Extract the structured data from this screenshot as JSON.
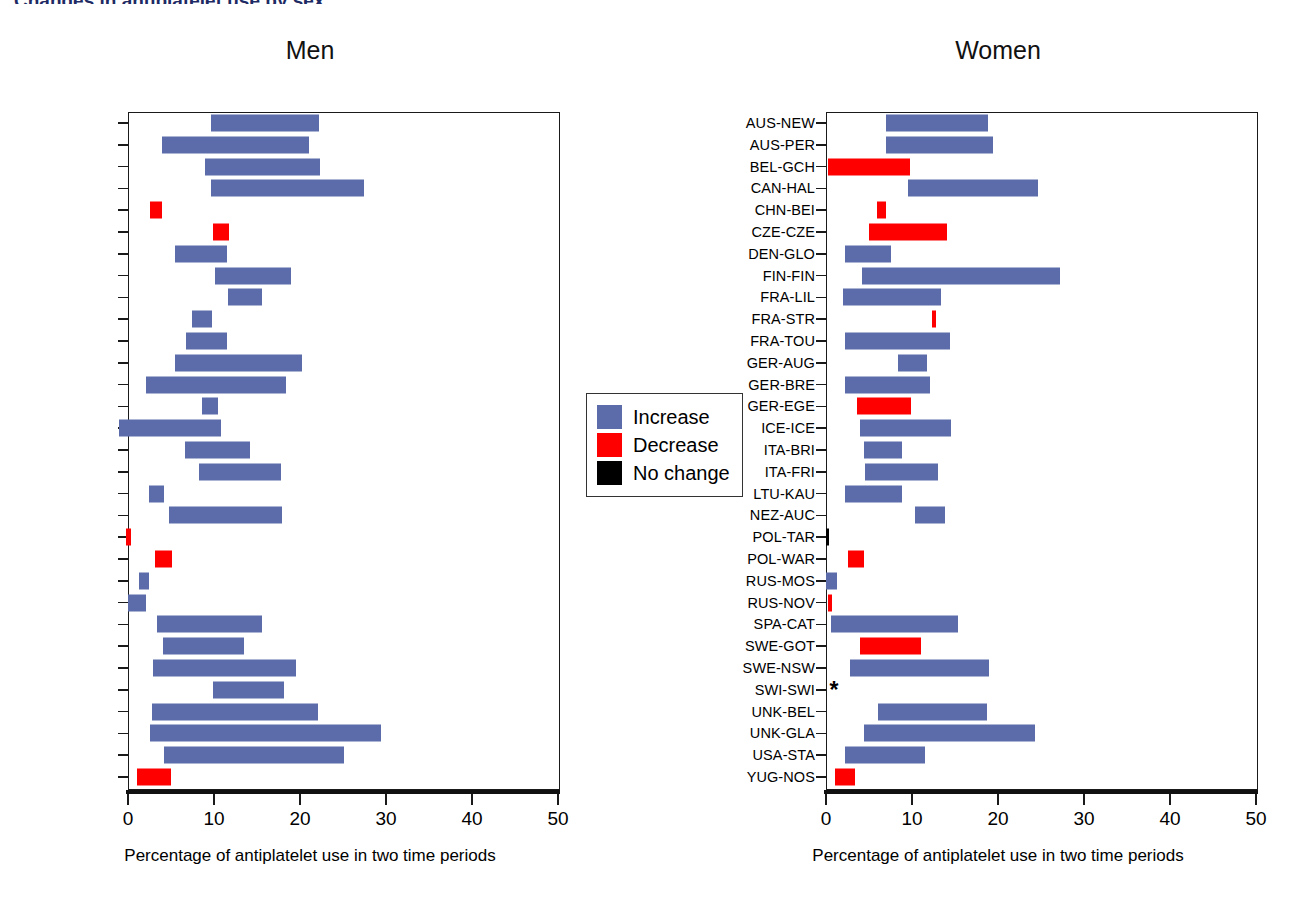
{
  "figure": {
    "cut_title": "Changes in antiplatelet use by sex",
    "axis_title": "Percentage of antiplatelet use in two time periods",
    "colors": {
      "increase": "#5c6cab",
      "decrease": "#fe0000",
      "no_change": "#000000"
    }
  },
  "legend": {
    "items": [
      {
        "label": "Increase",
        "key": "increase"
      },
      {
        "label": "Decrease",
        "key": "decrease"
      },
      {
        "label": "No change",
        "key": "no_change"
      }
    ]
  },
  "panels": [
    {
      "id": "men",
      "title": "Men"
    },
    {
      "id": "women",
      "title": "Women"
    }
  ],
  "chart_data": [
    {
      "type": "bar",
      "orientation": "horizontal",
      "title": "Men",
      "xlabel": "Percentage of antiplatelet use in two time periods",
      "ylabel": "",
      "xlim": [
        0,
        50
      ],
      "xticks": [
        0,
        10,
        20,
        30,
        40,
        50
      ],
      "grid": false,
      "legend": [
        "Increase",
        "Decrease",
        "No change"
      ],
      "note": "Each bar spans the two time-period percentages; color encodes direction of change.",
      "categories": [
        "AUS-NEW",
        "AUS-PER",
        "BEL-GCH",
        "CAN-HAL",
        "CHN-BEI",
        "CZE-CZE",
        "DEN-GLO",
        "FIN-FIN",
        "FRA-LIL",
        "FRA-STR",
        "FRA-TOU",
        "GER-AUG",
        "GER-BRE",
        "GER-EGE",
        "ICE-ICE",
        "ITA-BRI",
        "ITA-FRI",
        "LTU-KAU",
        "NEZ-AUC",
        "POL-TAR",
        "POL-WAR",
        "RUS-MOS",
        "RUS-NOV",
        "SPA-CAT",
        "SWE-GOT",
        "SWE-NSW",
        "SWI-SWI",
        "UNK-BEL",
        "UNK-GLA",
        "USA-STA",
        "YUG-NOS"
      ],
      "bars": [
        {
          "category": "AUS-NEW",
          "start": 9.7,
          "end": 22.2,
          "change": "increase"
        },
        {
          "category": "AUS-PER",
          "start": 4.0,
          "end": 21.0,
          "change": "increase"
        },
        {
          "category": "BEL-GCH",
          "start": 9.0,
          "end": 22.3,
          "change": "increase"
        },
        {
          "category": "CAN-HAL",
          "start": 9.6,
          "end": 27.5,
          "change": "increase"
        },
        {
          "category": "CHN-BEI",
          "start": 2.6,
          "end": 4.0,
          "change": "decrease"
        },
        {
          "category": "CZE-CZE",
          "start": 9.9,
          "end": 11.8,
          "change": "decrease"
        },
        {
          "category": "DEN-GLO",
          "start": 5.5,
          "end": 11.5,
          "change": "increase"
        },
        {
          "category": "FIN-FIN",
          "start": 10.1,
          "end": 18.9,
          "change": "increase"
        },
        {
          "category": "FRA-LIL",
          "start": 11.6,
          "end": 15.6,
          "change": "increase"
        },
        {
          "category": "FRA-STR",
          "start": 7.4,
          "end": 9.8,
          "change": "increase"
        },
        {
          "category": "FRA-TOU",
          "start": 6.8,
          "end": 11.5,
          "change": "increase"
        },
        {
          "category": "GER-AUG",
          "start": 5.5,
          "end": 20.2,
          "change": "increase"
        },
        {
          "category": "GER-BRE",
          "start": 2.1,
          "end": 18.4,
          "change": "increase"
        },
        {
          "category": "GER-EGE",
          "start": 8.6,
          "end": 10.5,
          "change": "increase"
        },
        {
          "category": "ICE-ICE",
          "start": -1.0,
          "end": 10.8,
          "change": "increase"
        },
        {
          "category": "ITA-BRI",
          "start": 6.6,
          "end": 14.2,
          "change": "increase"
        },
        {
          "category": "ITA-FRI",
          "start": 8.2,
          "end": 17.8,
          "change": "increase"
        },
        {
          "category": "LTU-KAU",
          "start": 2.4,
          "end": 4.2,
          "change": "increase"
        },
        {
          "category": "NEZ-AUC",
          "start": 4.8,
          "end": 17.9,
          "change": "increase"
        },
        {
          "category": "POL-TAR",
          "start": -0.2,
          "end": 0.3,
          "change": "decrease"
        },
        {
          "category": "POL-WAR",
          "start": 3.1,
          "end": 5.1,
          "change": "decrease"
        },
        {
          "category": "RUS-MOS",
          "start": 1.3,
          "end": 2.4,
          "change": "increase"
        },
        {
          "category": "RUS-NOV",
          "start": 0.0,
          "end": 2.1,
          "change": "increase"
        },
        {
          "category": "SPA-CAT",
          "start": 3.4,
          "end": 15.6,
          "change": "increase"
        },
        {
          "category": "SWE-GOT",
          "start": 4.1,
          "end": 13.5,
          "change": "increase"
        },
        {
          "category": "SWE-NSW",
          "start": 2.9,
          "end": 19.5,
          "change": "increase"
        },
        {
          "category": "SWI-SWI",
          "start": 9.9,
          "end": 18.1,
          "change": "increase"
        },
        {
          "category": "UNK-BEL",
          "start": 2.8,
          "end": 22.1,
          "change": "increase"
        },
        {
          "category": "UNK-GLA",
          "start": 2.6,
          "end": 29.4,
          "change": "increase"
        },
        {
          "category": "USA-STA",
          "start": 4.2,
          "end": 25.1,
          "change": "increase"
        },
        {
          "category": "YUG-NOS",
          "start": 1.0,
          "end": 5.0,
          "change": "decrease"
        }
      ]
    },
    {
      "type": "bar",
      "orientation": "horizontal",
      "title": "Women",
      "xlabel": "Percentage of antiplatelet use in two time periods",
      "ylabel": "",
      "xlim": [
        0,
        50
      ],
      "xticks": [
        0,
        10,
        20,
        30,
        40,
        50
      ],
      "grid": false,
      "legend": [
        "Increase",
        "Decrease",
        "No change"
      ],
      "note": "SWI-SWI marked with asterisk (no data shown).",
      "categories": [
        "AUS-NEW",
        "AUS-PER",
        "BEL-GCH",
        "CAN-HAL",
        "CHN-BEI",
        "CZE-CZE",
        "DEN-GLO",
        "FIN-FIN",
        "FRA-LIL",
        "FRA-STR",
        "FRA-TOU",
        "GER-AUG",
        "GER-BRE",
        "GER-EGE",
        "ICE-ICE",
        "ITA-BRI",
        "ITA-FRI",
        "LTU-KAU",
        "NEZ-AUC",
        "POL-TAR",
        "POL-WAR",
        "RUS-MOS",
        "RUS-NOV",
        "SPA-CAT",
        "SWE-GOT",
        "SWE-NSW",
        "SWI-SWI",
        "UNK-BEL",
        "UNK-GLA",
        "USA-STA",
        "YUG-NOS"
      ],
      "bars": [
        {
          "category": "AUS-NEW",
          "start": 7.0,
          "end": 18.8,
          "change": "increase"
        },
        {
          "category": "AUS-PER",
          "start": 7.0,
          "end": 19.4,
          "change": "increase"
        },
        {
          "category": "BEL-GCH",
          "start": 0.2,
          "end": 9.8,
          "change": "decrease"
        },
        {
          "category": "CAN-HAL",
          "start": 9.5,
          "end": 24.6,
          "change": "increase"
        },
        {
          "category": "CHN-BEI",
          "start": 5.9,
          "end": 7.0,
          "change": "decrease"
        },
        {
          "category": "CZE-CZE",
          "start": 5.0,
          "end": 14.1,
          "change": "decrease"
        },
        {
          "category": "DEN-GLO",
          "start": 2.2,
          "end": 7.6,
          "change": "increase"
        },
        {
          "category": "FIN-FIN",
          "start": 4.2,
          "end": 27.2,
          "change": "increase"
        },
        {
          "category": "FRA-LIL",
          "start": 2.0,
          "end": 13.4,
          "change": "increase"
        },
        {
          "category": "FRA-STR",
          "start": 12.3,
          "end": 12.8,
          "change": "decrease"
        },
        {
          "category": "FRA-TOU",
          "start": 2.2,
          "end": 14.4,
          "change": "increase"
        },
        {
          "category": "GER-AUG",
          "start": 8.4,
          "end": 11.8,
          "change": "increase"
        },
        {
          "category": "GER-BRE",
          "start": 2.2,
          "end": 12.1,
          "change": "increase"
        },
        {
          "category": "GER-EGE",
          "start": 3.6,
          "end": 9.9,
          "change": "decrease"
        },
        {
          "category": "ICE-ICE",
          "start": 3.9,
          "end": 14.5,
          "change": "increase"
        },
        {
          "category": "ITA-BRI",
          "start": 4.4,
          "end": 8.8,
          "change": "increase"
        },
        {
          "category": "ITA-FRI",
          "start": 4.5,
          "end": 13.0,
          "change": "increase"
        },
        {
          "category": "LTU-KAU",
          "start": 2.2,
          "end": 8.8,
          "change": "increase"
        },
        {
          "category": "NEZ-AUC",
          "start": 10.3,
          "end": 13.8,
          "change": "increase"
        },
        {
          "category": "POL-TAR",
          "start": 0.0,
          "end": 0.3,
          "change": "no_change"
        },
        {
          "category": "POL-WAR",
          "start": 2.5,
          "end": 4.4,
          "change": "decrease"
        },
        {
          "category": "RUS-MOS",
          "start": 0.0,
          "end": 1.3,
          "change": "increase"
        },
        {
          "category": "RUS-NOV",
          "start": 0.2,
          "end": 0.7,
          "change": "decrease"
        },
        {
          "category": "SPA-CAT",
          "start": 0.6,
          "end": 15.4,
          "change": "increase"
        },
        {
          "category": "SWE-GOT",
          "start": 3.9,
          "end": 11.0,
          "change": "decrease"
        },
        {
          "category": "SWE-NSW",
          "start": 2.8,
          "end": 18.9,
          "change": "increase"
        },
        {
          "category": "SWI-SWI",
          "start": null,
          "end": null,
          "change": "none",
          "marker": "*"
        },
        {
          "category": "UNK-BEL",
          "start": 6.0,
          "end": 18.7,
          "change": "increase"
        },
        {
          "category": "UNK-GLA",
          "start": 4.4,
          "end": 24.3,
          "change": "increase"
        },
        {
          "category": "USA-STA",
          "start": 2.2,
          "end": 11.5,
          "change": "increase"
        },
        {
          "category": "YUG-NOS",
          "start": 1.0,
          "end": 3.4,
          "change": "decrease"
        }
      ]
    }
  ]
}
